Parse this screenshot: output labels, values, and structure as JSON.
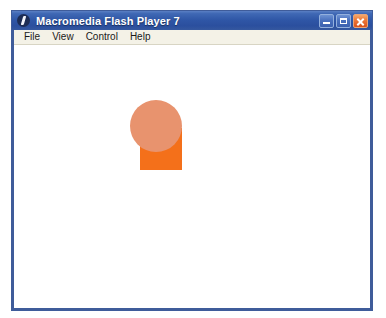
{
  "window": {
    "title": "Macromedia Flash Player 7",
    "logo_icon": "flash-logo-icon",
    "controls": {
      "minimize_label": "Minimize",
      "maximize_label": "Maximize",
      "close_label": "Close"
    },
    "border_color": "#3f5c9a",
    "titlebar_color": "#2f56a6"
  },
  "menu": {
    "items": [
      {
        "label": "File"
      },
      {
        "label": "View"
      },
      {
        "label": "Control"
      },
      {
        "label": "Help"
      }
    ]
  },
  "stage": {
    "background_color": "#ffffff",
    "shapes": [
      {
        "name": "square",
        "type": "rectangle",
        "color": "#f4701a",
        "x": 126,
        "y": 83,
        "width": 42,
        "height": 42
      },
      {
        "name": "circle",
        "type": "circle",
        "color": "#e8936e",
        "x": 116,
        "y": 55,
        "width": 52,
        "height": 52
      }
    ]
  }
}
